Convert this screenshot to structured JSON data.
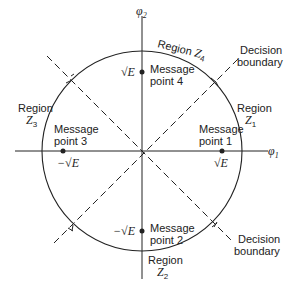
{
  "diagram": {
    "axes": {
      "horizontal_label": "φ",
      "horizontal_sub": "1",
      "vertical_label": "φ",
      "vertical_sub": "2"
    },
    "message_points": [
      {
        "id": 1,
        "line1": "Message",
        "line2": "point 1",
        "coord_label": "√E"
      },
      {
        "id": 2,
        "line1": "Message",
        "line2": "point 2",
        "coord_label": "−√E"
      },
      {
        "id": 3,
        "line1": "Message",
        "line2": "point 3",
        "coord_label": "−√E"
      },
      {
        "id": 4,
        "line1": "Message",
        "line2": "point 4",
        "coord_label": "√E"
      }
    ],
    "regions": [
      {
        "id": 1,
        "label": "Region",
        "name": "Z",
        "sub": "1"
      },
      {
        "id": 2,
        "label": "Region",
        "name": "Z",
        "sub": "2"
      },
      {
        "id": 3,
        "label": "Region",
        "name": "Z",
        "sub": "3"
      },
      {
        "id": 4,
        "label": "Region",
        "name": "Z",
        "sub": "4"
      }
    ],
    "decision_boundaries": [
      {
        "line1": "Decision",
        "line2": "boundary"
      },
      {
        "line1": "Decision",
        "line2": "boundary"
      }
    ],
    "colors": {
      "ink": "#222222",
      "background": "#ffffff"
    }
  }
}
